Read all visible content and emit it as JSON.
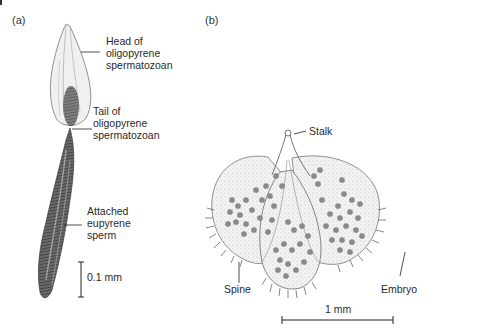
{
  "figure": {
    "panel_a": {
      "label": "(a)",
      "callouts": {
        "head": "Head of\noligopyrene\nspermatozoan",
        "tail": "Tail of\noligopyrene\nspermatozoan",
        "eupyrene": "Attached\neupyrene\nsperm"
      },
      "scale_bar": {
        "label": "0.1 mm"
      }
    },
    "panel_b": {
      "label": "(b)",
      "callouts": {
        "stalk": "Stalk",
        "spine": "Spine",
        "embryo": "Embryo"
      },
      "scale_bar": {
        "label": "1 mm"
      }
    },
    "colors": {
      "ink": "#2a2a2a",
      "sperm_dark": "#4a4a4a",
      "cyst_fill": "#efefef",
      "embryo": "#8a8a8a"
    }
  }
}
